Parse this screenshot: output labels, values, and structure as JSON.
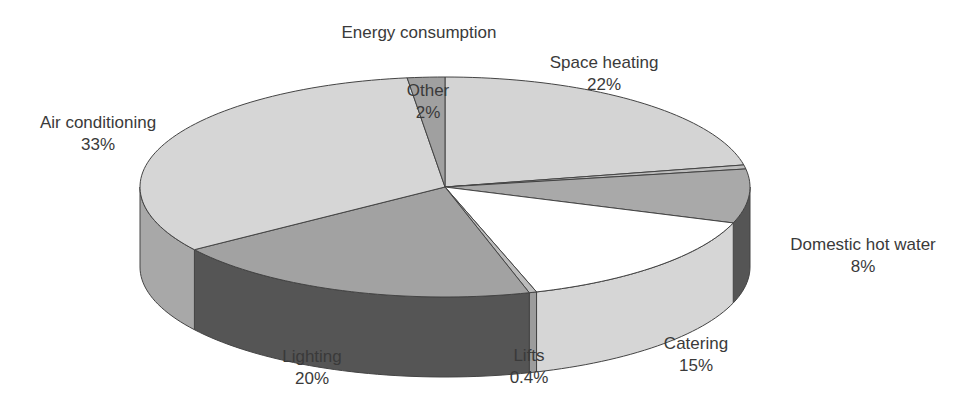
{
  "chart_data": {
    "type": "pie",
    "style": "3d",
    "title": "Energy consumption",
    "start": "top",
    "direction": "clockwise",
    "slices": [
      {
        "name": "Space heating",
        "value": 22,
        "label": "22%",
        "top_color": "#d4d4d4",
        "side_color": "#c6c6c6",
        "show_label": true
      },
      {
        "name": "",
        "value": 0.6,
        "label": "",
        "top_color": "#bdbdbd",
        "side_color": "#9a9a9a",
        "show_label": false
      },
      {
        "name": "Domestic hot water",
        "value": 8,
        "label": "8%",
        "top_color": "#a9a9a9",
        "side_color": "#555555",
        "show_label": true
      },
      {
        "name": "Catering",
        "value": 15,
        "label": "15%",
        "top_color": "#ffffff",
        "side_color": "#d6d6d6",
        "show_label": true
      },
      {
        "name": "Lifts",
        "value": 0.4,
        "label": "0.4%",
        "top_color": "#bcbcbc",
        "side_color": "#9c9c9c",
        "show_label": true
      },
      {
        "name": "Lighting",
        "value": 20,
        "label": "20%",
        "top_color": "#a2a2a2",
        "side_color": "#555555",
        "show_label": true
      },
      {
        "name": "Air conditioning",
        "value": 33,
        "label": "33%",
        "top_color": "#d6d6d6",
        "side_color": "#a8a8a8",
        "show_label": true
      },
      {
        "name": "Other",
        "value": 2,
        "label": "2%",
        "top_color": "#a0a0a0",
        "side_color": "#909090",
        "show_label": true
      }
    ],
    "outline_color": "#444444",
    "legend": "none"
  }
}
